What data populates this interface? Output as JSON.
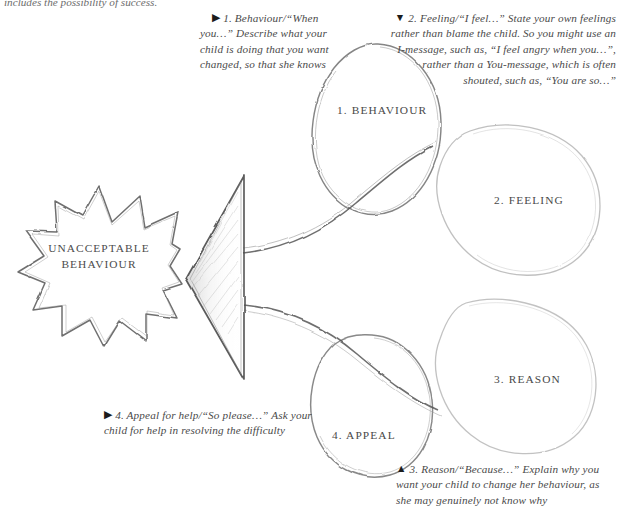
{
  "page": {
    "background_color": "#ffffff",
    "ink_color": "#555555",
    "text_color": "#4a4a4a",
    "width": 620,
    "height": 529
  },
  "truncated_header": {
    "text": "includes the possibility of success."
  },
  "core": {
    "label_line1": "UNACCEPTABLE",
    "label_line2": "BEHAVIOUR"
  },
  "petals": [
    {
      "id": "behaviour",
      "label": "1. BEHAVIOUR"
    },
    {
      "id": "feeling",
      "label": "2. FEELING"
    },
    {
      "id": "reason",
      "label": "3. REASON"
    },
    {
      "id": "appeal",
      "label": "4. APPEAL"
    }
  ],
  "notes": [
    {
      "id": "behaviour",
      "marker": "▶",
      "marker_name": "triangle-right-icon",
      "heading": "1. Behaviour/“When you…”",
      "body": "Describe what your child is doing that you want changed, so that she knows"
    },
    {
      "id": "feeling",
      "marker": "▼",
      "marker_name": "triangle-down-icon",
      "heading": "2. Feeling/“I feel…”",
      "body": "State your own feelings rather than blame the child. So you might use an I-message, such as, “I feel angry when you…”, rather than a You-message, which is often shouted, such as, “You are so…”"
    },
    {
      "id": "appeal",
      "marker": "▶",
      "marker_name": "triangle-right-icon",
      "heading": "4. Appeal for help/“So please…”",
      "body": "Ask your child for help in resolving the difficulty"
    },
    {
      "id": "reason",
      "marker": "▲",
      "marker_name": "triangle-up-icon",
      "heading": "3. Reason/“Because…”",
      "body": "Explain why you want your child to change her behaviour, as she may genuinely not know why"
    }
  ],
  "arrow": {
    "name": "left-pointing-arrow",
    "direction": "left"
  }
}
